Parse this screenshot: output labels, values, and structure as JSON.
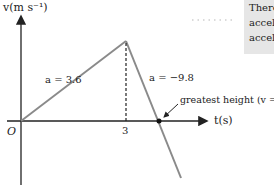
{
  "diagram": {
    "type": "velocity-time graph",
    "y_axis_label": "v(m s⁻¹)",
    "x_axis_label": "t(s)",
    "origin_label": "O",
    "x_tick_label": "3",
    "segment1_label": "a = 3.6",
    "segment2_label": "a = −9.8",
    "annotation": "greatest height (v = 0)",
    "colors": {
      "line": "#8a8a8a",
      "axis": "#222222",
      "side_box": "#e6e6e6"
    }
  },
  "side_text": {
    "lines": [
      "There",
      "accel",
      "accel"
    ]
  }
}
